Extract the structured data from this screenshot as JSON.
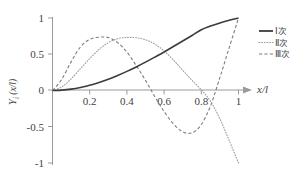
{
  "chart_data": {
    "type": "line",
    "title": "",
    "xlabel": "x/l",
    "ylabel": "Yᵢ (x/l)",
    "xlim": [
      0,
      1.08
    ],
    "ylim": [
      -1,
      1
    ],
    "grid": false,
    "legend_position": "right",
    "xticks": [
      "0.2",
      "0.4",
      "0.6",
      "0.8",
      "1"
    ],
    "xtick_values": [
      0.2,
      0.4,
      0.6,
      0.8,
      1.0
    ],
    "yticks": [
      "1",
      "0.5",
      "0",
      "-0.5",
      "-1"
    ],
    "ytick_values": [
      1,
      0.5,
      0,
      -0.5,
      -1
    ],
    "x": [
      0,
      0.05,
      0.1,
      0.15,
      0.2,
      0.25,
      0.3,
      0.35,
      0.4,
      0.45,
      0.5,
      0.55,
      0.6,
      0.65,
      0.7,
      0.75,
      0.8,
      0.85,
      0.9,
      0.95,
      1.0
    ],
    "series": [
      {
        "name": "Ⅰ次",
        "style": "solid",
        "color": "#3b3b3b",
        "values": [
          0,
          0.005,
          0.019,
          0.042,
          0.073,
          0.111,
          0.156,
          0.207,
          0.264,
          0.325,
          0.391,
          0.46,
          0.532,
          0.606,
          0.682,
          0.759,
          0.837,
          0.888,
          0.932,
          0.968,
          1.0
        ]
      },
      {
        "name": "Ⅱ次",
        "style": "dotted",
        "color": "#9b9b9b",
        "values": [
          0,
          0.05,
          0.16,
          0.3,
          0.44,
          0.565,
          0.66,
          0.715,
          0.732,
          0.727,
          0.7,
          0.64,
          0.545,
          0.42,
          0.28,
          0.14,
          0.01,
          -0.15,
          -0.39,
          -0.69,
          -1.0
        ]
      },
      {
        "name": "Ⅲ次",
        "style": "dashed",
        "color": "#7d7d7d",
        "values": [
          0,
          0.155,
          0.395,
          0.6,
          0.705,
          0.735,
          0.73,
          0.66,
          0.53,
          0.345,
          0.14,
          -0.085,
          -0.29,
          -0.46,
          -0.57,
          -0.585,
          -0.47,
          -0.21,
          0.18,
          0.59,
          1.0
        ]
      }
    ],
    "annotations": []
  },
  "legend": {
    "items": [
      {
        "label": "Ⅰ次"
      },
      {
        "label": "Ⅱ次"
      },
      {
        "label": "Ⅲ次"
      }
    ]
  },
  "axis": {
    "x_arrow": true,
    "x_title": "x/l",
    "y_title_main": "Y",
    "y_title_sub": "i",
    "y_title_paren": "(x/l)"
  }
}
